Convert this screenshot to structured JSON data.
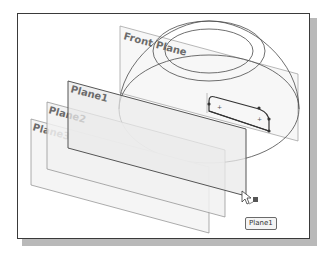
{
  "scene": {
    "planes": [
      {
        "name": "front-plane",
        "label": "Front Plane"
      },
      {
        "name": "plane1",
        "label": "Plane1"
      },
      {
        "name": "plane2",
        "label": "Plane2"
      },
      {
        "name": "plane3",
        "label": "Plane3"
      }
    ],
    "tooltip": "Plane1",
    "cursor": "pointer-with-plane-icon"
  },
  "colors": {
    "frame": "#3a3a3a",
    "shadow": "#b9b9b9",
    "plane_edge": "#8a8a8a",
    "plane_fill": "#ececec",
    "label": "#6b6b6b"
  }
}
